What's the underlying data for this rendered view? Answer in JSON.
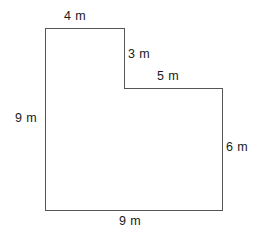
{
  "figure": {
    "kind": "l-shaped-polygon",
    "unit": "m",
    "stroke_color": "#555555",
    "fill_color": "#ffffff",
    "background_color": "#ffffff",
    "stroke_width": 1,
    "outline_points": "45,28 124,28 124,88 222,88 222,210 45,210",
    "labels": {
      "top": "4 m",
      "step_vertical": "3 m",
      "step_horizontal": "5 m",
      "right": "6 m",
      "left": "9 m",
      "bottom": "9 m"
    }
  },
  "chart_data": {
    "type": "diagram",
    "title": "",
    "shape": "L-shaped hexagon",
    "unit": "m",
    "vertices": [
      {
        "x": 45,
        "y": 28
      },
      {
        "x": 124,
        "y": 28
      },
      {
        "x": 124,
        "y": 88
      },
      {
        "x": 222,
        "y": 88
      },
      {
        "x": 222,
        "y": 210
      },
      {
        "x": 45,
        "y": 210
      }
    ],
    "sides": [
      {
        "name": "top",
        "label": "4 m",
        "length": 4,
        "orientation": "horizontal",
        "from": 0,
        "to": 1
      },
      {
        "name": "step-vertical",
        "label": "3 m",
        "length": 3,
        "orientation": "vertical",
        "from": 1,
        "to": 2
      },
      {
        "name": "step-horizontal",
        "label": "5 m",
        "length": 5,
        "orientation": "horizontal",
        "from": 2,
        "to": 3
      },
      {
        "name": "right",
        "label": "6 m",
        "length": 6,
        "orientation": "vertical",
        "from": 3,
        "to": 4
      },
      {
        "name": "bottom",
        "label": "9 m",
        "length": 9,
        "orientation": "horizontal",
        "from": 4,
        "to": 5
      },
      {
        "name": "left",
        "label": "9 m",
        "length": 9,
        "orientation": "vertical",
        "from": 5,
        "to": 0
      }
    ]
  }
}
